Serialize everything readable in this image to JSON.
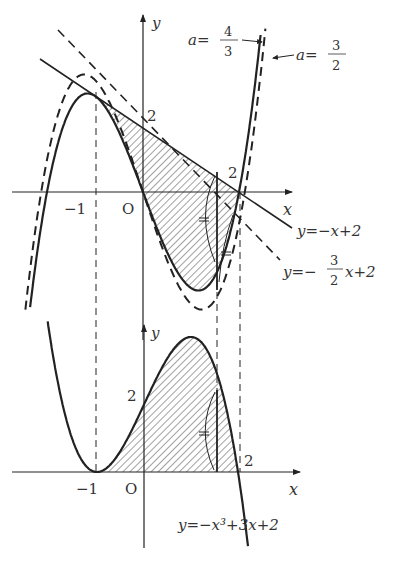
{
  "figure": {
    "top_graph": {
      "axis_x_label": "x",
      "axis_y_label": "y",
      "origin_label": "O",
      "tick_x_neg1": "−1",
      "tick_x_2": "2",
      "tick_y_2": "2",
      "curve_solid_label": "a=",
      "curve_solid_num": "4",
      "curve_solid_den": "3",
      "curve_dashed_label": "a=",
      "curve_dashed_num": "3",
      "curve_dashed_den": "2",
      "line_solid_label": "y=−x+2",
      "line_dashed_label_pre": "y=−",
      "line_dashed_num": "3",
      "line_dashed_den": "2",
      "line_dashed_label_post": "x+2"
    },
    "bottom_graph": {
      "axis_x_label": "x",
      "axis_y_label": "y",
      "origin_label": "O",
      "tick_x_neg1": "−1",
      "tick_x_2": "2",
      "tick_y_2": "2",
      "curve_label": "y=−x³+3x+2"
    },
    "colors": {
      "ink": "#222222",
      "hatch": "#444444",
      "background": "#ffffff"
    }
  }
}
